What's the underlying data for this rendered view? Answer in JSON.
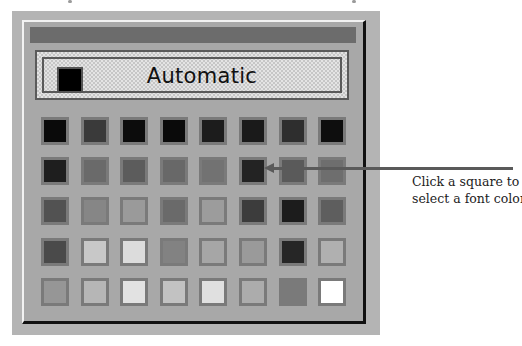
{
  "palette": {
    "title_bar_color": "#6c6c6c",
    "automatic_option": {
      "label": "Automatic",
      "swatch_color": "#000000"
    },
    "swatches": [
      [
        "#0a0a0a",
        "#3a3a3a",
        "#0c0c0c",
        "#0a0a0a",
        "#1c1c1c",
        "#1a1a1a",
        "#2e2e2e",
        "#0e0e0e"
      ],
      [
        "#1e1e1e",
        "#6a6a6a",
        "#5c5c5c",
        "#686868",
        "#727272",
        "#232323",
        "#5a5a5a",
        "#6e6e6e"
      ],
      [
        "#525252",
        "#868686",
        "#9a9a9a",
        "#6a6a6a",
        "#9c9c9c",
        "#3c3c3c",
        "#1c1c1c",
        "#5e5e5e"
      ],
      [
        "#4a4a4a",
        "#c8c8c8",
        "#dcdcdc",
        "#828282",
        "#a6a6a6",
        "#9a9a9a",
        "#262626",
        "#b0b0b0"
      ],
      [
        "#969696",
        "#b6b6b6",
        "#e2e2e2",
        "#c2c2c2",
        "#e0e0e0",
        "#acacac",
        "#7a7a7a",
        "#ffffff"
      ]
    ]
  },
  "callout": {
    "line1": "Click a square to",
    "line2": "select a font color"
  }
}
